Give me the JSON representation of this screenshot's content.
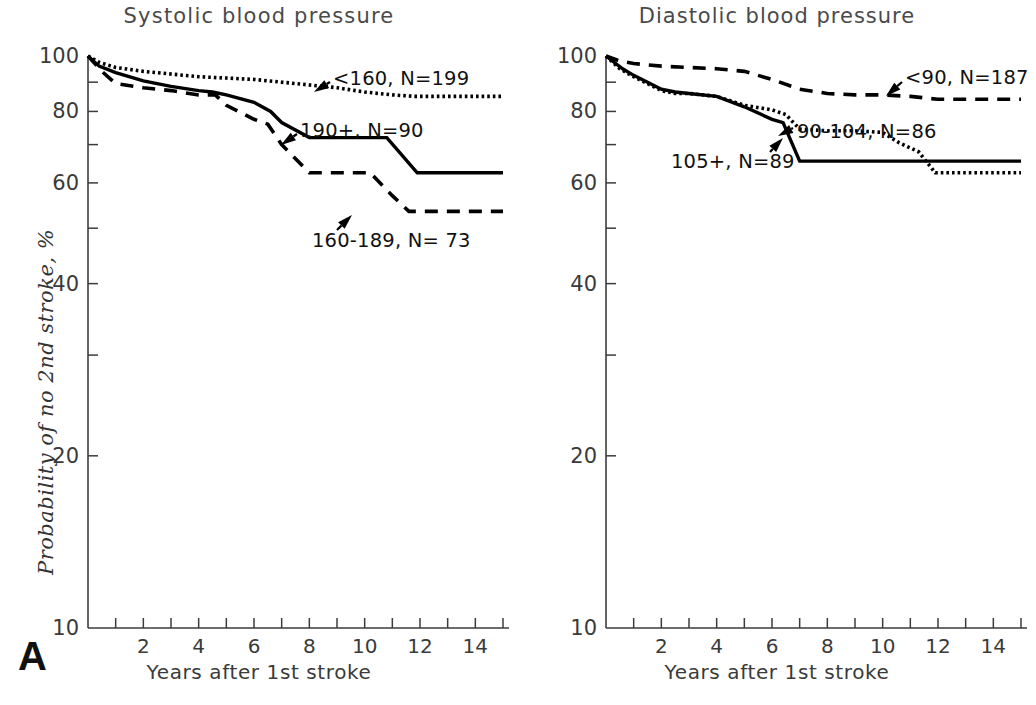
{
  "figure": {
    "name": "probability-of-no-second-stroke-by-blood-pressure",
    "panels": [
      "A",
      "B"
    ]
  },
  "panel_a": {
    "letter": "A",
    "title": "Systolic  blood  pressure",
    "xlabel": "Years  after 1st stroke",
    "ylabel": "Probability of no 2nd stroke, %"
  },
  "panel_b": {
    "letter": "B",
    "title": "Diastolic  blood  pressure",
    "xlabel": "Years  after 1st stroke",
    "ylabel": "Probability of no 2nd stroke, %"
  },
  "axes": {
    "y_tick_values": [
      100,
      90,
      80,
      70,
      60,
      50,
      40,
      30,
      20,
      10
    ],
    "y_tick_labels": [
      "100",
      "",
      "80",
      "",
      "60",
      "",
      "40",
      "",
      "20",
      "10"
    ],
    "y_scale": "log",
    "ylim": [
      10,
      100
    ],
    "x_tick_values": [
      0,
      1,
      2,
      3,
      4,
      5,
      6,
      7,
      8,
      9,
      10,
      11,
      12,
      13,
      14,
      15
    ],
    "x_tick_labels": [
      "",
      "",
      "2",
      "",
      "4",
      "",
      "6",
      "",
      "8",
      "",
      "10",
      "",
      "12",
      "",
      "14",
      ""
    ],
    "xlim": [
      0,
      15
    ],
    "grid": false
  },
  "chart_data": [
    {
      "type": "line",
      "title": "Systolic  blood  pressure",
      "xlabel": "Years  after 1st stroke",
      "ylabel": "Probability of no 2nd stroke, %",
      "panel": "A",
      "yscale": "log",
      "ylim": [
        10,
        100
      ],
      "xlim": [
        0,
        15
      ],
      "grid": false,
      "legend": "inline-annotations",
      "series": [
        {
          "name": "<160, N=199",
          "label": "<160, N=199",
          "group": "<160",
          "n": 199,
          "style": "dotted",
          "annotation_text": "<160, N=199",
          "x": [
            0,
            0.4,
            1,
            2,
            3,
            4,
            5,
            6,
            7,
            8,
            9,
            10,
            11,
            11.8,
            15
          ],
          "y": [
            100,
            97.5,
            95.5,
            94,
            93,
            92,
            91.5,
            91,
            90,
            89,
            88,
            86.5,
            85.5,
            85,
            85
          ]
        },
        {
          "name": "190+, N=90",
          "label": "190+, N=90",
          "group": "190+",
          "n": 90,
          "style": "solid",
          "annotation_text": "190+, N=90",
          "x": [
            0,
            0.4,
            1,
            2,
            3,
            4,
            4.5,
            5,
            6,
            6.6,
            7,
            8,
            9,
            10,
            10.8,
            11.9,
            15
          ],
          "y": [
            100,
            96,
            93.5,
            90.5,
            88.5,
            87,
            86.5,
            85.5,
            83,
            80,
            76.5,
            72,
            72,
            72,
            72,
            62.5,
            62.5
          ]
        },
        {
          "name": "160-189, N=73",
          "label": "160-189, N= 73",
          "group": "160-189",
          "n": 73,
          "style": "dashed",
          "annotation_text": "160-189, N= 73",
          "x": [
            0,
            0.5,
            1,
            2,
            3,
            4,
            4.6,
            5,
            6,
            6.5,
            7,
            8,
            9,
            10,
            10.2,
            11,
            11.6,
            15
          ],
          "y": [
            100,
            94,
            89.5,
            88,
            87,
            85.5,
            85.5,
            82,
            77.5,
            76,
            70,
            62.5,
            62.5,
            62.5,
            62.5,
            57,
            53.5,
            53.5
          ]
        }
      ]
    },
    {
      "type": "line",
      "title": "Diastolic  blood  pressure",
      "xlabel": "Years  after 1st stroke",
      "ylabel": "Probability of no 2nd stroke, %",
      "panel": "B",
      "yscale": "log",
      "ylim": [
        10,
        100
      ],
      "xlim": [
        0,
        15
      ],
      "grid": false,
      "legend": "inline-annotations",
      "series": [
        {
          "name": "<90, N=187",
          "label": "<90, N=187",
          "group": "<90",
          "n": 187,
          "style": "dashed",
          "annotation_text": "<90, N=187",
          "x": [
            0,
            0.5,
            1,
            2,
            3,
            4,
            5,
            6,
            7,
            8,
            9,
            10,
            11,
            12,
            15
          ],
          "y": [
            100,
            98,
            97,
            96,
            95.5,
            95,
            94,
            91,
            87.5,
            86,
            85.5,
            85.5,
            85,
            84,
            84
          ]
        },
        {
          "name": "90-104, N=86",
          "label": "90-104, N=86",
          "group": "90-104",
          "n": 86,
          "style": "dotted",
          "annotation_text": "90-104, N=86",
          "x": [
            0,
            0.5,
            1,
            2,
            2.5,
            3,
            4,
            5,
            6,
            6.5,
            7,
            8,
            9,
            10,
            10.6,
            11.3,
            11.9,
            15
          ],
          "y": [
            100,
            95,
            92,
            87,
            86,
            86,
            85,
            82,
            80.5,
            79,
            74.5,
            74,
            74,
            73.5,
            70.5,
            68,
            62.5,
            62.5
          ]
        },
        {
          "name": "105+, N=89",
          "label": "105+, N=89",
          "group": "105+",
          "n": 89,
          "style": "solid",
          "annotation_text": "105+, N=89",
          "x": [
            0,
            0.6,
            1,
            2,
            2.5,
            3,
            4,
            5,
            6,
            6.4,
            7,
            8,
            10,
            12,
            15
          ],
          "y": [
            100,
            95,
            92.5,
            87.5,
            86.5,
            86,
            85,
            81.5,
            77.5,
            76.5,
            65.5,
            65.5,
            65.5,
            65.5,
            65.5
          ]
        }
      ]
    }
  ],
  "annotations": {
    "panel_a": [
      {
        "name": "annotation-lt160",
        "text": "<160, N=199",
        "x": 333,
        "y": 79,
        "arrow_from": [
          330,
          82
        ],
        "arrow_to": [
          314,
          92
        ]
      },
      {
        "name": "annotation-190plus",
        "text": "190+, N=90",
        "x": 300,
        "y": 131,
        "arrow_from": [
          297,
          134
        ],
        "arrow_to": [
          281,
          145
        ]
      },
      {
        "name": "annotation-160-189",
        "text": "160-189, N= 73",
        "x": 312,
        "y": 241,
        "arrow_from": [
          337,
          230
        ],
        "arrow_to": [
          352,
          215
        ]
      }
    ],
    "panel_b": [
      {
        "name": "annotation-lt90",
        "text": "<90, N=187",
        "x": 905,
        "y": 78,
        "arrow_from": [
          902,
          82
        ],
        "arrow_to": [
          886,
          96
        ]
      },
      {
        "name": "annotation-90-104",
        "text": "90-104, N=86",
        "x": 797,
        "y": 132,
        "arrow_from": [
          793,
          128
        ],
        "arrow_to": [
          778,
          136
        ]
      },
      {
        "name": "annotation-105plus",
        "text": "105+, N=89",
        "x": 671,
        "y": 162,
        "arrow_from": [
          770,
          152
        ],
        "arrow_to": [
          783,
          138
        ]
      }
    ]
  },
  "colors": {
    "ink": "#000000",
    "axis": "#3c3c3c",
    "title": "#4a4a4a",
    "background": "#ffffff"
  }
}
